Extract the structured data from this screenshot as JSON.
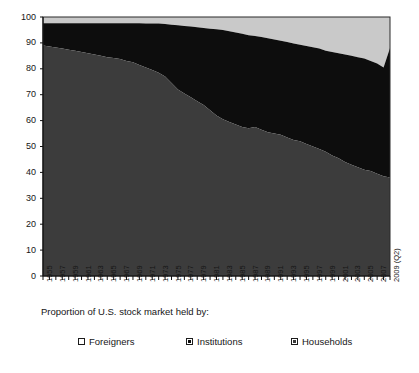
{
  "chart_data": {
    "type": "area",
    "stacked": true,
    "title": "",
    "xlabel": "Proportion of U.S. stock market held by:",
    "ylabel": "",
    "ylim": [
      0,
      100
    ],
    "yticks": [
      0,
      10,
      20,
      30,
      40,
      50,
      60,
      70,
      80,
      90,
      100
    ],
    "grid": false,
    "legend_position": "bottom",
    "x_tick_labels": [
      "1955",
      "1957",
      "1959",
      "1961",
      "1963",
      "1965",
      "1967",
      "1969",
      "1971",
      "1973",
      "1975",
      "1977",
      "1979",
      "1981",
      "1983",
      "1985",
      "1987",
      "1989",
      "1991",
      "1993",
      "1995",
      "1997",
      "1999",
      "2001",
      "2003",
      "2005",
      "2007",
      "2009 (Q2)"
    ],
    "x": [
      "1955",
      "1956",
      "1957",
      "1958",
      "1959",
      "1960",
      "1961",
      "1962",
      "1963",
      "1964",
      "1965",
      "1966",
      "1967",
      "1968",
      "1969",
      "1970",
      "1971",
      "1972",
      "1973",
      "1974",
      "1975",
      "1976",
      "1977",
      "1978",
      "1979",
      "1980",
      "1981",
      "1982",
      "1983",
      "1984",
      "1985",
      "1986",
      "1987",
      "1988",
      "1989",
      "1990",
      "1991",
      "1992",
      "1993",
      "1994",
      "1995",
      "1996",
      "1997",
      "1998",
      "1999",
      "2000",
      "2001",
      "2002",
      "2003",
      "2004",
      "2005",
      "2006",
      "2007",
      "2008",
      "2009 (Q2)"
    ],
    "series": [
      {
        "name": "Households",
        "color": "#3c3c3c",
        "values": [
          89.0,
          88.6,
          88.2,
          87.8,
          87.4,
          87.0,
          86.5,
          86.0,
          85.5,
          85.0,
          84.5,
          84.2,
          83.8,
          83.0,
          82.5,
          81.5,
          80.5,
          79.5,
          78.5,
          77.0,
          74.5,
          72.0,
          70.5,
          69.0,
          67.5,
          66.0,
          64.0,
          62.0,
          60.5,
          59.5,
          58.5,
          57.5,
          57.0,
          57.5,
          56.5,
          55.5,
          55.0,
          54.5,
          53.5,
          52.5,
          52.0,
          51.0,
          50.0,
          49.0,
          48.0,
          46.5,
          45.5,
          44.0,
          43.0,
          42.0,
          41.0,
          40.5,
          39.5,
          38.5,
          38.0
        ]
      },
      {
        "name": "Institutions",
        "color": "#0d0d0d",
        "values": [
          8.6,
          9.0,
          9.4,
          9.8,
          10.2,
          10.6,
          11.1,
          11.6,
          12.1,
          12.6,
          13.1,
          13.4,
          13.8,
          14.6,
          15.1,
          16.1,
          17.0,
          18.0,
          19.0,
          20.3,
          22.5,
          24.8,
          26.0,
          27.3,
          28.5,
          29.8,
          31.5,
          33.3,
          34.5,
          35.0,
          35.5,
          36.0,
          36.0,
          35.2,
          35.8,
          36.3,
          36.3,
          36.3,
          36.8,
          37.3,
          37.3,
          37.8,
          38.3,
          38.8,
          39.0,
          40.0,
          40.5,
          41.5,
          42.0,
          42.5,
          43.0,
          42.5,
          42.5,
          42.0,
          50.0
        ]
      },
      {
        "name": "Foreigners",
        "color": "#c9c9c9",
        "values": [
          2.4,
          2.4,
          2.4,
          2.4,
          2.4,
          2.4,
          2.4,
          2.4,
          2.4,
          2.4,
          2.4,
          2.4,
          2.4,
          2.4,
          2.4,
          2.4,
          2.5,
          2.5,
          2.5,
          2.7,
          3.0,
          3.2,
          3.5,
          3.7,
          4.0,
          4.2,
          4.5,
          4.7,
          5.0,
          5.5,
          6.0,
          6.5,
          7.0,
          7.3,
          7.7,
          8.2,
          8.7,
          9.2,
          9.7,
          10.2,
          10.7,
          11.2,
          11.7,
          12.2,
          13.0,
          13.5,
          14.0,
          14.5,
          15.0,
          15.5,
          16.0,
          17.0,
          18.0,
          19.5,
          12.0
        ]
      }
    ],
    "boundaries": {
      "households_top": [
        89.0,
        88.6,
        88.2,
        87.8,
        87.4,
        87.0,
        86.5,
        86.0,
        85.5,
        85.0,
        84.5,
        84.2,
        83.8,
        83.0,
        82.5,
        81.5,
        80.5,
        79.5,
        78.5,
        77.0,
        74.5,
        72.0,
        70.5,
        69.0,
        67.5,
        66.0,
        64.0,
        62.0,
        60.5,
        59.5,
        58.5,
        57.5,
        57.0,
        57.5,
        56.5,
        55.5,
        55.0,
        54.5,
        53.5,
        52.5,
        52.0,
        51.0,
        50.0,
        49.0,
        48.0,
        46.5,
        45.5,
        44.0,
        43.0,
        42.0,
        41.0,
        40.5,
        39.5,
        38.5,
        38.0
      ],
      "institutions_top": [
        97.6,
        97.6,
        97.6,
        97.6,
        97.6,
        97.6,
        97.6,
        97.6,
        97.6,
        97.6,
        97.6,
        97.6,
        97.6,
        97.6,
        97.6,
        97.6,
        97.5,
        97.5,
        97.5,
        97.3,
        97.0,
        96.8,
        96.5,
        96.3,
        96.0,
        95.8,
        95.5,
        95.3,
        95.0,
        94.5,
        94.0,
        93.5,
        93.0,
        92.7,
        92.3,
        91.8,
        91.3,
        90.8,
        90.3,
        89.8,
        89.3,
        88.8,
        88.3,
        87.8,
        87.0,
        86.5,
        86.0,
        85.5,
        85.0,
        84.5,
        84.0,
        83.0,
        82.0,
        80.5,
        88.0
      ],
      "total": 100
    }
  },
  "axis": {
    "y_ticks": [
      "0",
      "10",
      "20",
      "30",
      "40",
      "50",
      "60",
      "70",
      "80",
      "90",
      "100"
    ],
    "x_title": "Proportion of U.S. stock market held by:"
  },
  "legend": {
    "items": [
      {
        "label": "Foreigners",
        "color": "#ffffff",
        "border": "#1c1c1c"
      },
      {
        "label": "Institutions",
        "color": "#0d0d0d",
        "border": "#1c1c1c"
      },
      {
        "label": "Households",
        "color": "#3c3c3c",
        "border": "#1c1c1c"
      }
    ]
  }
}
